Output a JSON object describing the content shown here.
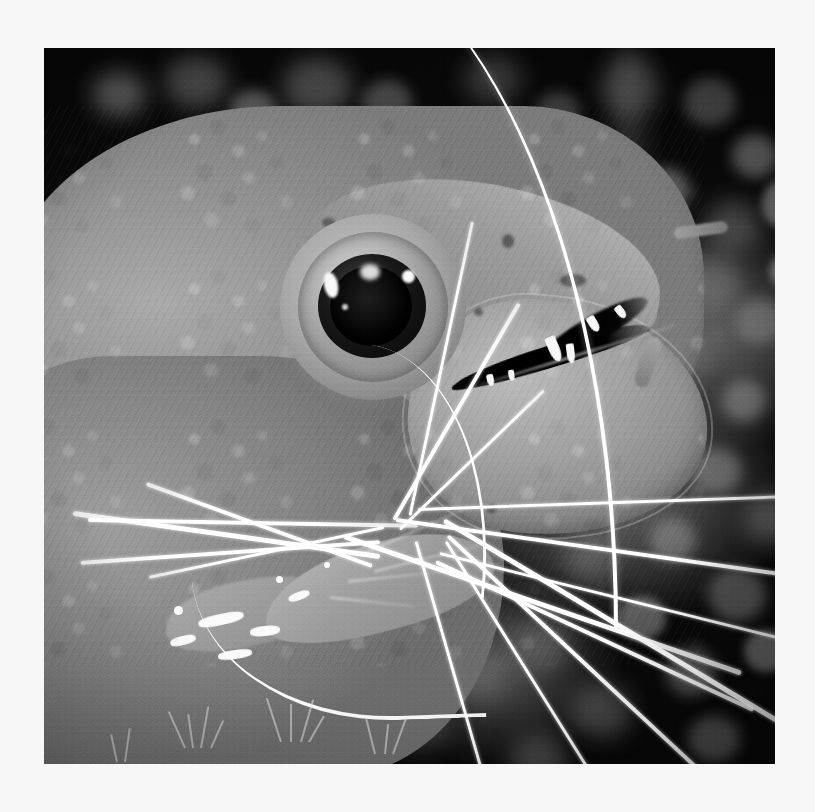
{
  "page": {
    "background_color": "#f7f7f7",
    "caption": ""
  },
  "photo": {
    "title": "Moray eel head in profile with cleaner shrimp",
    "palette": {
      "paper": "#f7f7f7",
      "background_dark": "#0c0c0c",
      "coral_blob": "#6e6e6e",
      "eel_skin_light": "#b9b9b9",
      "eel_skin_mid": "#9a9a9a",
      "eel_skin_dark": "#7a7a7a",
      "antenna_white": "#ffffff",
      "tooth_white": "#f2f2f2",
      "pupil_black": "#060606"
    },
    "frame": {
      "left": 44,
      "top": 48,
      "width": 731,
      "height": 716
    },
    "colorspace": "grayscale",
    "subjects": [
      {
        "name": "moray-eel",
        "pose": "profile facing right",
        "mouth": "slightly open showing teeth"
      },
      {
        "name": "cleaner-shrimp",
        "location": "at eel mouth, lower centre-left",
        "feature": "long white antennae radiating outward"
      },
      {
        "name": "reef-background",
        "location": "right side and bottom",
        "feature": "dark with blurred pale coral blobs"
      }
    ],
    "bokeh_blobs": [
      {
        "x": 48,
        "y": 24,
        "w": 54,
        "h": 44,
        "c": "rgba(150,150,150,.55)",
        "k": "soft"
      },
      {
        "x": 120,
        "y": 8,
        "w": 64,
        "h": 52,
        "c": "rgba(128,128,128,.5)",
        "k": "soft"
      },
      {
        "x": 186,
        "y": 42,
        "w": 46,
        "h": 40,
        "c": "rgba(160,160,160,.5)",
        "k": ""
      },
      {
        "x": 238,
        "y": 10,
        "w": 70,
        "h": 58,
        "c": "rgba(140,140,140,.45)",
        "k": "soft"
      },
      {
        "x": 318,
        "y": 32,
        "w": 50,
        "h": 44,
        "c": "rgba(150,150,150,.42)",
        "k": ""
      },
      {
        "x": 420,
        "y": 6,
        "w": 58,
        "h": 50,
        "c": "rgba(120,120,120,.4)",
        "k": "soft"
      },
      {
        "x": 492,
        "y": 44,
        "w": 44,
        "h": 38,
        "c": "rgba(135,135,135,.4)",
        "k": ""
      },
      {
        "x": 556,
        "y": 12,
        "w": 60,
        "h": 56,
        "c": "rgba(128,128,128,.42)",
        "k": "soft"
      },
      {
        "x": 640,
        "y": 30,
        "w": 52,
        "h": 48,
        "c": "rgba(150,150,150,.42)",
        "k": ""
      },
      {
        "x": 688,
        "y": 86,
        "w": 46,
        "h": 44,
        "c": "rgba(168,168,168,.5)",
        "k": ""
      },
      {
        "x": 660,
        "y": 152,
        "w": 58,
        "h": 52,
        "c": "rgba(140,140,140,.45)",
        "k": "soft"
      },
      {
        "x": 596,
        "y": 120,
        "w": 50,
        "h": 46,
        "c": "rgba(175,175,175,.5)",
        "k": ""
      },
      {
        "x": 634,
        "y": 206,
        "w": 64,
        "h": 58,
        "c": "rgba(148,148,148,.46)",
        "k": "soft"
      },
      {
        "x": 574,
        "y": 184,
        "w": 40,
        "h": 38,
        "c": "rgba(182,182,182,.5)",
        "k": "hard"
      },
      {
        "x": 692,
        "y": 250,
        "w": 48,
        "h": 46,
        "c": "rgba(160,160,160,.45)",
        "k": ""
      },
      {
        "x": 612,
        "y": 286,
        "w": 56,
        "h": 50,
        "c": "rgba(130,130,130,.42)",
        "k": "soft"
      },
      {
        "x": 678,
        "y": 332,
        "w": 44,
        "h": 42,
        "c": "rgba(172,172,172,.48)",
        "k": ""
      },
      {
        "x": 586,
        "y": 352,
        "w": 60,
        "h": 54,
        "c": "rgba(142,142,142,.44)",
        "k": "soft"
      },
      {
        "x": 648,
        "y": 400,
        "w": 50,
        "h": 46,
        "c": "rgba(165,165,165,.46)",
        "k": ""
      },
      {
        "x": 548,
        "y": 412,
        "w": 42,
        "h": 40,
        "c": "rgba(185,185,185,.5)",
        "k": "hard"
      },
      {
        "x": 700,
        "y": 446,
        "w": 54,
        "h": 50,
        "c": "rgba(150,150,150,.44)",
        "k": "soft"
      },
      {
        "x": 606,
        "y": 470,
        "w": 46,
        "h": 44,
        "c": "rgba(170,170,170,.46)",
        "k": ""
      },
      {
        "x": 520,
        "y": 486,
        "w": 52,
        "h": 48,
        "c": "rgba(140,140,140,.42)",
        "k": "soft"
      },
      {
        "x": 664,
        "y": 520,
        "w": 58,
        "h": 54,
        "c": "rgba(158,158,158,.45)",
        "k": ""
      },
      {
        "x": 574,
        "y": 548,
        "w": 48,
        "h": 44,
        "c": "rgba(178,178,178,.48)",
        "k": "hard"
      },
      {
        "x": 470,
        "y": 570,
        "w": 56,
        "h": 50,
        "c": "rgba(132,132,132,.4)",
        "k": "soft"
      },
      {
        "x": 622,
        "y": 600,
        "w": 50,
        "h": 48,
        "c": "rgba(162,162,162,.44)",
        "k": ""
      },
      {
        "x": 700,
        "y": 582,
        "w": 44,
        "h": 42,
        "c": "rgba(176,176,176,.46)",
        "k": "hard"
      },
      {
        "x": 528,
        "y": 636,
        "w": 60,
        "h": 54,
        "c": "rgba(145,145,145,.42)",
        "k": "soft"
      },
      {
        "x": 410,
        "y": 612,
        "w": 48,
        "h": 44,
        "c": "rgba(128,128,128,.38)",
        "k": "soft"
      },
      {
        "x": 644,
        "y": 668,
        "w": 52,
        "h": 46,
        "c": "rgba(156,156,156,.42)",
        "k": ""
      },
      {
        "x": 350,
        "y": 656,
        "w": 54,
        "h": 48,
        "c": "rgba(120,120,120,.36)",
        "k": "soft"
      },
      {
        "x": 258,
        "y": 672,
        "w": 46,
        "h": 42,
        "c": "rgba(138,138,138,.38)",
        "k": ""
      },
      {
        "x": 466,
        "y": 688,
        "w": 58,
        "h": 50,
        "c": "rgba(150,150,150,.4)",
        "k": "soft"
      },
      {
        "x": 132,
        "y": 636,
        "w": 40,
        "h": 36,
        "c": "rgba(198,198,198,.42)",
        "k": "hard"
      },
      {
        "x": 60,
        "y": 660,
        "w": 44,
        "h": 40,
        "c": "rgba(180,180,180,.38)",
        "k": ""
      },
      {
        "x": 196,
        "y": 700,
        "w": 50,
        "h": 44,
        "c": "rgba(135,135,135,.34)",
        "k": "soft"
      },
      {
        "x": 718,
        "y": 132,
        "w": 40,
        "h": 48,
        "c": "rgba(188,188,188,.5)",
        "k": "hard"
      },
      {
        "x": 726,
        "y": 206,
        "w": 36,
        "h": 34,
        "c": "rgba(200,200,200,.52)",
        "k": "hard"
      }
    ],
    "head_spots": [
      {
        "x": 318,
        "y": 112,
        "w": 13,
        "h": 9
      },
      {
        "x": 498,
        "y": 128,
        "w": 12,
        "h": 14
      },
      {
        "x": 386,
        "y": 244,
        "w": 10,
        "h": 8
      },
      {
        "x": 556,
        "y": 168,
        "w": 26,
        "h": 13
      },
      {
        "x": 482,
        "y": 398,
        "w": 11,
        "h": 9
      },
      {
        "x": 470,
        "y": 202,
        "w": 9,
        "h": 8
      }
    ],
    "teeth": [
      {
        "x": 104,
        "y": 10,
        "w": 11,
        "h": 26,
        "r": -6
      },
      {
        "x": 120,
        "y": 22,
        "w": 8,
        "h": 20,
        "r": 10
      },
      {
        "x": 150,
        "y": 2,
        "w": 9,
        "h": 17,
        "r": -14
      },
      {
        "x": 36,
        "y": 28,
        "w": 7,
        "h": 12,
        "r": 4
      },
      {
        "x": 58,
        "y": 30,
        "w": 6,
        "h": 11,
        "r": 8
      },
      {
        "x": 180,
        "y": 0,
        "w": 8,
        "h": 14,
        "r": -20
      }
    ],
    "shrimp_stripes": [
      {
        "x": 34,
        "y": 96,
        "w": 46,
        "h": 11,
        "r": -12
      },
      {
        "x": 86,
        "y": 108,
        "w": 30,
        "h": 10,
        "r": -6
      },
      {
        "x": 6,
        "y": 118,
        "w": 26,
        "h": 9,
        "r": -14
      },
      {
        "x": 54,
        "y": 132,
        "w": 34,
        "h": 9,
        "r": -8
      },
      {
        "x": 124,
        "y": 74,
        "w": 22,
        "h": 8,
        "r": -20
      }
    ],
    "shrimp_dots": [
      {
        "x": 10,
        "y": 88,
        "d": 9
      },
      {
        "x": 112,
        "y": 58,
        "d": 7
      },
      {
        "x": 160,
        "y": 44,
        "d": 6
      },
      {
        "x": 206,
        "y": 24,
        "d": 5
      },
      {
        "x": 250,
        "y": 40,
        "d": 6
      }
    ],
    "antennae": [
      {
        "x": 44,
        "y": 470,
        "len": 330,
        "rot": 1,
        "k": "med"
      },
      {
        "x": 300,
        "y": 486,
        "len": 420,
        "rot": 19,
        "k": "thick"
      },
      {
        "x": 352,
        "y": 470,
        "len": 430,
        "rot": 8,
        "k": "med"
      },
      {
        "x": 374,
        "y": 460,
        "len": 380,
        "rot": -2,
        "k": "thin"
      },
      {
        "x": 400,
        "y": 470,
        "len": 400,
        "rot": 31,
        "k": "thick"
      },
      {
        "x": 404,
        "y": 486,
        "len": 390,
        "rot": 43,
        "k": "med"
      },
      {
        "x": 402,
        "y": 492,
        "len": 330,
        "rot": 58,
        "k": "thin"
      },
      {
        "x": 372,
        "y": 492,
        "len": 300,
        "rot": 74,
        "k": "thin"
      },
      {
        "x": 350,
        "y": 470,
        "len": 250,
        "rot": -60,
        "k": "med"
      },
      {
        "x": 366,
        "y": 466,
        "len": 300,
        "rot": -78,
        "k": "thin"
      },
      {
        "x": 356,
        "y": 480,
        "len": 200,
        "rot": -44,
        "k": "thin"
      },
      {
        "x": 340,
        "y": 478,
        "len": 240,
        "rot": 168,
        "k": "thin"
      },
      {
        "x": 336,
        "y": 492,
        "len": 300,
        "rot": 176,
        "k": "med"
      },
      {
        "x": 336,
        "y": 506,
        "len": 310,
        "rot": 188,
        "k": "thick"
      },
      {
        "x": 328,
        "y": 516,
        "len": 240,
        "rot": 200,
        "k": "med"
      },
      {
        "x": 396,
        "y": 504,
        "len": 360,
        "rot": 14,
        "k": "thin"
      },
      {
        "x": 392,
        "y": 512,
        "len": 350,
        "rot": 25,
        "k": "med"
      },
      {
        "x": 120,
        "y": 406,
        "len": 220,
        "rot": 28,
        "k": "faint"
      },
      {
        "x": 94,
        "y": 430,
        "len": 190,
        "rot": 34,
        "k": "faint"
      },
      {
        "x": 150,
        "y": 352,
        "len": 240,
        "rot": 36,
        "k": "faint"
      },
      {
        "x": 196,
        "y": 318,
        "len": 220,
        "rot": 42,
        "k": "faint"
      },
      {
        "x": 258,
        "y": 300,
        "len": 200,
        "rot": 56,
        "k": "faint"
      }
    ],
    "legs": [
      {
        "x": 196,
        "y": 36,
        "len": 120,
        "rot": -24
      },
      {
        "x": 210,
        "y": 52,
        "len": 110,
        "rot": -14
      },
      {
        "x": 184,
        "y": 62,
        "len": 96,
        "rot": -6
      },
      {
        "x": 166,
        "y": 78,
        "len": 86,
        "rot": 6
      }
    ],
    "sprigs": [
      {
        "x": 140,
        "y": 700,
        "h": 40,
        "r": -24
      },
      {
        "x": 148,
        "y": 700,
        "h": 34,
        "r": -8
      },
      {
        "x": 156,
        "y": 700,
        "h": 42,
        "r": 10
      },
      {
        "x": 166,
        "y": 700,
        "h": 30,
        "r": 24
      },
      {
        "x": 236,
        "y": 694,
        "h": 46,
        "r": -18
      },
      {
        "x": 246,
        "y": 694,
        "h": 38,
        "r": 0
      },
      {
        "x": 256,
        "y": 694,
        "h": 44,
        "r": 16
      },
      {
        "x": 264,
        "y": 694,
        "h": 30,
        "r": 30
      },
      {
        "x": 330,
        "y": 706,
        "h": 36,
        "r": -14
      },
      {
        "x": 340,
        "y": 706,
        "h": 30,
        "r": 6
      },
      {
        "x": 348,
        "y": 706,
        "h": 38,
        "r": 20
      },
      {
        "x": 72,
        "y": 714,
        "h": 28,
        "r": -12
      },
      {
        "x": 80,
        "y": 714,
        "h": 34,
        "r": 8
      }
    ]
  }
}
